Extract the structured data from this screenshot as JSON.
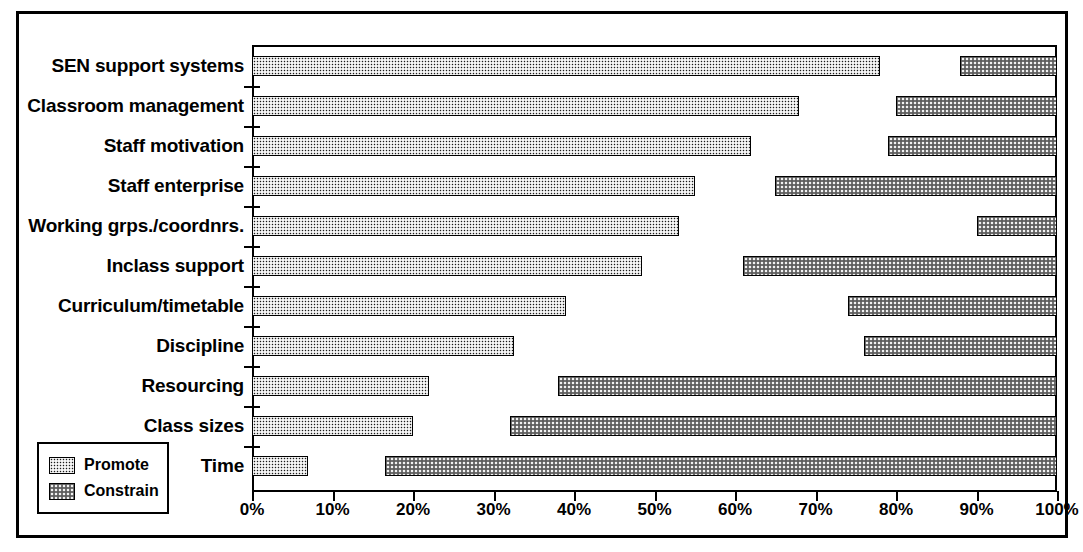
{
  "chart_data": {
    "type": "bar",
    "orientation": "horizontal",
    "title": "",
    "xlabel": "",
    "ylabel": "",
    "xlim": [
      0,
      100
    ],
    "x_tick_labels": [
      "0%",
      "10%",
      "20%",
      "30%",
      "40%",
      "50%",
      "60%",
      "70%",
      "80%",
      "90%",
      "100%"
    ],
    "x_tick_values": [
      0,
      10,
      20,
      30,
      40,
      50,
      60,
      70,
      80,
      90,
      100
    ],
    "grid": false,
    "legend_position": "bottom-left",
    "legend": [
      {
        "name": "Promote",
        "pattern": "dark-checkerboard",
        "color": "#1a1a1a"
      },
      {
        "name": "Constrain",
        "pattern": "light-checkerboard",
        "color": "#f2f2f2"
      }
    ],
    "categories": [
      "SEN support systems",
      "Classroom management",
      "Staff motivation",
      "Staff enterprise",
      "Working grps./coordnrs.",
      "Inclass support",
      "Curriculum/timetable",
      "Discipline",
      "Resourcing",
      "Class sizes",
      "Time"
    ],
    "series": [
      {
        "name": "Promote",
        "anchor": "left",
        "values": [
          78,
          68,
          62,
          55,
          53,
          48.5,
          39,
          32.5,
          22,
          20,
          7
        ]
      },
      {
        "name": "Constrain",
        "anchor": "right",
        "starts": [
          88,
          80,
          79,
          65,
          90,
          61,
          74,
          76,
          38,
          32,
          16.5
        ],
        "ends": [
          100,
          100,
          100,
          100,
          100,
          100,
          100,
          100,
          100,
          100,
          100
        ],
        "values": [
          12,
          20,
          21,
          35,
          10,
          39,
          26,
          24,
          62,
          68,
          83.5
        ]
      }
    ]
  }
}
